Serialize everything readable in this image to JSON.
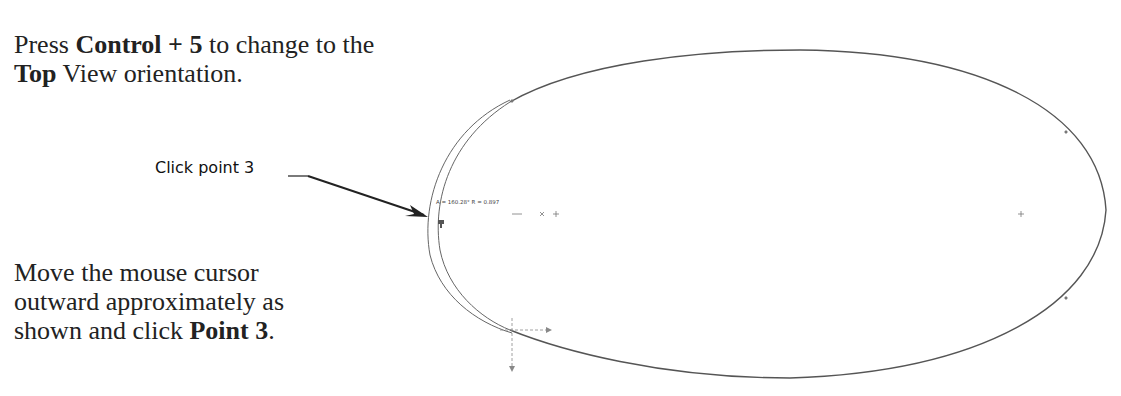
{
  "instructions": {
    "step1": {
      "pre": "Press ",
      "key1": "Control + 5",
      "mid1": " to change to the ",
      "key2": "Top",
      "post": " View orientation."
    },
    "step2": {
      "text": "Move the mouse cursor outward approximately as shown and click ",
      "bold": "Point 3",
      "post": "."
    }
  },
  "callout": {
    "label": "Click point 3"
  },
  "sketch": {
    "readout": "A = 160.28° R = 0.897",
    "cursor_icon": "sketch-arc-cursor",
    "line_color": "#555555"
  }
}
